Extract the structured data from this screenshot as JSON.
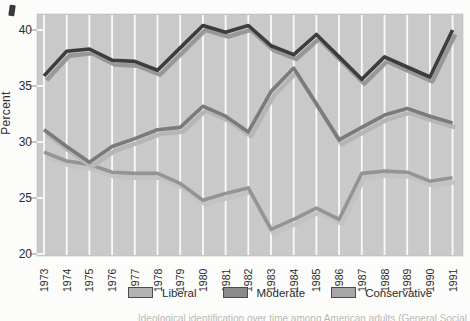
{
  "y_axis": {
    "title": "Percent",
    "ticks": [
      40,
      35,
      30,
      25,
      20
    ]
  },
  "x_axis": {
    "labels": [
      "1973",
      "1974",
      "1975",
      "1976",
      "1977",
      "1978",
      "1979",
      "1980",
      "1981",
      "1982",
      "1983",
      "1984",
      "1985",
      "1986",
      "1987",
      "1988",
      "1989",
      "1990",
      "1991"
    ]
  },
  "legend": [
    {
      "label": "Liberal",
      "swatch_color": "#b3b3b3"
    },
    {
      "label": "Moderate",
      "swatch_color": "#8a8a8a"
    },
    {
      "label": "Conservative",
      "swatch_color": "#a6a6a6"
    }
  ],
  "caption_fragment": "Ideological identification over time among American adults (General Social Survey)",
  "colors": {
    "plot_background": "#c9c9c9",
    "gridline": "#fafafa",
    "tick": "#b2b2b2",
    "liberal_line": "#949494",
    "liberal_shadow": "#c3c3c3",
    "moderate_line": "#3d3d3d",
    "moderate_shadow": "#989898",
    "conservative_line": "#7b7b7b",
    "conservative_shadow": "#b6b6b6"
  },
  "chart_data": {
    "type": "line",
    "title": "",
    "xlabel": "",
    "ylabel": "Percent",
    "x": [
      1973,
      1974,
      1975,
      1976,
      1977,
      1978,
      1979,
      1980,
      1981,
      1982,
      1983,
      1984,
      1985,
      1986,
      1987,
      1988,
      1989,
      1990,
      1991
    ],
    "series": [
      {
        "name": "Liberal",
        "values": [
          29.1,
          28.3,
          28.0,
          27.3,
          27.2,
          27.2,
          26.3,
          24.8,
          25.4,
          25.9,
          22.2,
          23.1,
          24.1,
          23.1,
          27.2,
          27.4,
          27.3,
          26.5,
          26.8
        ]
      },
      {
        "name": "Moderate",
        "values": [
          35.9,
          38.1,
          38.3,
          37.3,
          37.2,
          36.4,
          38.4,
          40.4,
          39.8,
          40.4,
          38.6,
          37.8,
          39.6,
          37.6,
          35.6,
          37.6,
          36.7,
          35.8,
          40.0
        ]
      },
      {
        "name": "Conservative",
        "values": [
          31.1,
          29.6,
          28.2,
          29.6,
          30.3,
          31.1,
          31.3,
          33.2,
          32.3,
          30.9,
          34.5,
          36.6,
          33.4,
          30.2,
          31.3,
          32.4,
          33.0,
          32.3,
          31.7
        ]
      }
    ],
    "ylim": [
      20,
      41.5
    ],
    "grid": "vertical-white-gridlines",
    "legend_position": "bottom"
  }
}
